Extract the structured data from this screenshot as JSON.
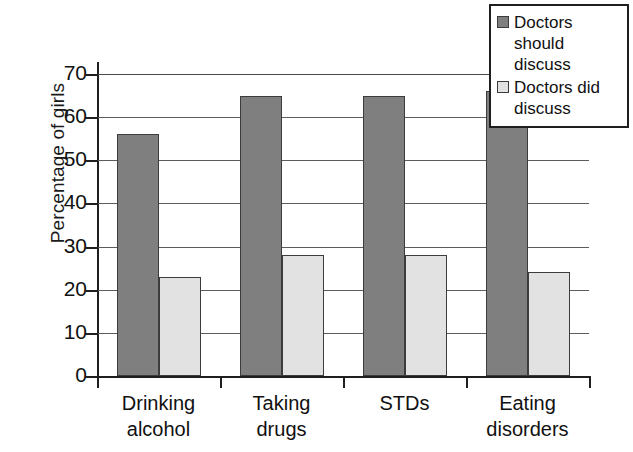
{
  "chart_data": {
    "type": "bar",
    "title": "",
    "xlabel": "",
    "ylabel": "Percentage of girls",
    "ylim": [
      0,
      70
    ],
    "ytick_step": 10,
    "yticks": [
      0,
      10,
      20,
      30,
      40,
      50,
      60,
      70
    ],
    "grid": true,
    "legend_position": "top-right",
    "categories": [
      "Drinking alcohol",
      "Taking drugs",
      "STDs",
      "Eating disorders"
    ],
    "category_lines": [
      [
        "Drinking",
        "alcohol"
      ],
      [
        "Taking",
        "drugs"
      ],
      [
        "STDs",
        ""
      ],
      [
        "Eating",
        "disorders"
      ]
    ],
    "series": [
      {
        "name": "Doctors should discuss",
        "name_lines": [
          "Doctors should",
          "discuss"
        ],
        "color": "#7f7f7f",
        "values": [
          56,
          65,
          65,
          66
        ]
      },
      {
        "name": "Doctors did discuss",
        "name_lines": [
          "Doctors did",
          "discuss"
        ],
        "color": "#e2e2e2",
        "values": [
          23,
          28,
          28,
          24
        ]
      }
    ]
  },
  "colors": {
    "series_dark": "#7f7f7f",
    "series_light": "#e2e2e2",
    "axis": "#1f1f1f",
    "grid": "#5c5c5c",
    "text": "#111111",
    "background": "#ffffff"
  }
}
